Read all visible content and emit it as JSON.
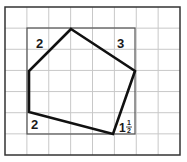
{
  "diagram": {
    "grid": {
      "cols": 8,
      "rows": 7,
      "x0": 5,
      "y0": 7,
      "x1": 180,
      "y1": 155
    },
    "bounding_rect": {
      "x": 27,
      "y": 28,
      "w": 108,
      "h": 106
    },
    "polygon": [
      [
        71,
        29
      ],
      [
        135,
        71
      ],
      [
        113,
        134
      ],
      [
        29,
        112
      ],
      [
        29,
        71
      ]
    ],
    "labels": {
      "top_left": "2",
      "top_right": "3",
      "bottom_left": "2",
      "bottom_right_whole": "1",
      "bottom_right_num": "1",
      "bottom_right_den": "2"
    },
    "colors": {
      "grid": "#c8c8c8",
      "rect": "#555555",
      "polygon": "#111111",
      "border": "#333333"
    }
  }
}
